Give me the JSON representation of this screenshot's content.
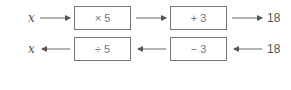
{
  "forward_row": {
    "input": "x",
    "ops": [
      "× 5",
      "+ 3"
    ],
    "output": "18",
    "direction": "left-to-right"
  },
  "inverse_row": {
    "output": "x",
    "ops": [
      "÷ 5",
      "− 3"
    ],
    "input": "18",
    "direction": "right-to-left"
  },
  "colors": {
    "line": "#777777",
    "text": "#555555"
  }
}
